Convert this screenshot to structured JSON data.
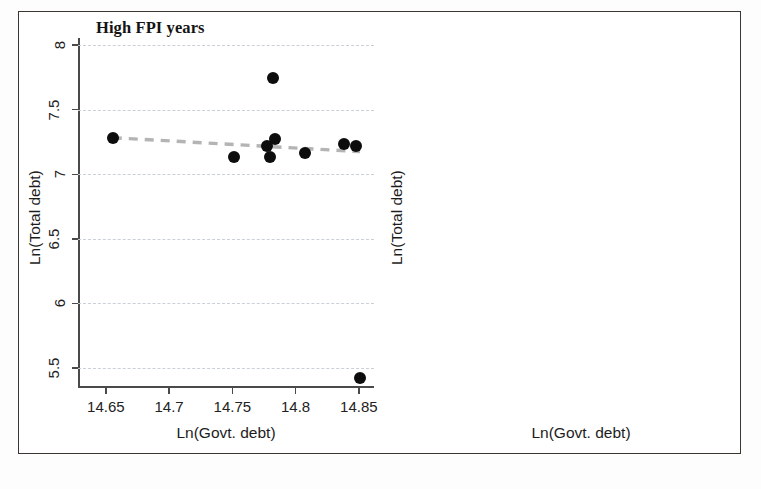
{
  "figure": {
    "axis_x_title": "Ln(Govt. debt)",
    "axis_y_title": "Ln(Total debt)"
  },
  "chart_data": [
    {
      "type": "scatter",
      "title": "High FPI years",
      "xlabel": "Ln(Govt. debt)",
      "ylabel": "Ln(Total debt)",
      "xlim": [
        14.628,
        14.862
      ],
      "ylim": [
        5.345,
        8.055
      ],
      "xticks": [
        14.65,
        14.7,
        14.75,
        14.8,
        14.85
      ],
      "xticklabels": [
        "14.65",
        "14.7",
        "14.75",
        "14.8",
        "14.85"
      ],
      "yticks": [
        5.5,
        6,
        6.5,
        7,
        7.5,
        8
      ],
      "yticklabels": [
        "5.5",
        "6",
        "6.5",
        "7",
        "7.5",
        "8"
      ],
      "grid": true,
      "grid_axis": "y",
      "legend": "none",
      "marker": "filled-circle",
      "marker_color": "#0d0d0d",
      "points": [
        {
          "x": 14.6555,
          "y": 7.283
        },
        {
          "x": 14.7515,
          "y": 7.137
        },
        {
          "x": 14.7775,
          "y": 7.222
        },
        {
          "x": 14.7795,
          "y": 7.133
        },
        {
          "x": 14.7825,
          "y": 7.742
        },
        {
          "x": 14.7835,
          "y": 7.275
        },
        {
          "x": 14.8075,
          "y": 7.163
        },
        {
          "x": 14.8385,
          "y": 7.237
        },
        {
          "x": 14.8475,
          "y": 7.222
        },
        {
          "x": 14.851,
          "y": 5.42
        }
      ],
      "trendline": {
        "style": "dashed",
        "color": "#b4b4b4",
        "x0": 14.6555,
        "y0": 7.283,
        "x1": 14.851,
        "y1": 7.175
      }
    },
    {
      "type": "scatter",
      "title": "Low FPI years",
      "xlabel": "Ln(Govt. debt)",
      "ylabel": "Ln(Total debt)",
      "xlim": [
        14.8375,
        15.004
      ],
      "ylim": [
        6.958,
        7.522
      ],
      "xticks": [
        14.85,
        14.9,
        14.95,
        15
      ],
      "xticklabels": [
        "14.85",
        "14.9",
        "14.95",
        "15"
      ],
      "yticks": [
        7,
        7.1,
        7.2,
        7.3,
        7.4,
        7.5
      ],
      "yticklabels": [
        "7",
        "7.1",
        "7.2",
        "7.3",
        "7.4",
        "7.5"
      ],
      "grid": true,
      "grid_axis": "y",
      "legend": "none",
      "marker": "filled-circle",
      "marker_color": "#0d0d0d",
      "points": [
        {
          "x": 14.842,
          "y": 7.448
        },
        {
          "x": 14.878,
          "y": 7.482
        },
        {
          "x": 14.88,
          "y": 6.975
        },
        {
          "x": 14.89,
          "y": 7.197
        },
        {
          "x": 14.9035,
          "y": 7.364
        },
        {
          "x": 14.97,
          "y": 7.254
        }
      ],
      "trendline": {
        "style": "dashed",
        "color": "#b4b4b4",
        "x0": 14.842,
        "y0": 7.401,
        "x1": 14.972,
        "y1": 7.148
      }
    }
  ]
}
